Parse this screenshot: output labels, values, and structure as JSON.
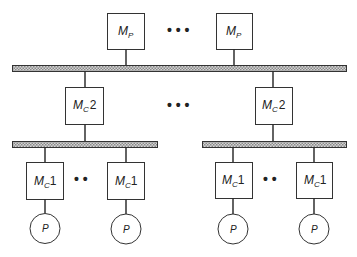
{
  "diagram": {
    "type": "hierarchical memory bus diagram",
    "colors": {
      "line": "#222222",
      "bus_fill": "#c8c8c8",
      "bus_hatch": "#8a8a8a",
      "background": "#ffffff"
    },
    "top_memories": [
      {
        "label": "M",
        "subscript": "P"
      },
      {
        "label": "M",
        "subscript": "P"
      }
    ],
    "top_ellipsis": "• • •",
    "level2_caches": [
      {
        "label": "M",
        "subscript": "C",
        "suffix": "2"
      },
      {
        "label": "M",
        "subscript": "C",
        "suffix": "2"
      }
    ],
    "level2_ellipsis": "• • •",
    "level1_caches": [
      {
        "label": "M",
        "subscript": "C",
        "suffix": "1"
      },
      {
        "label": "M",
        "subscript": "C",
        "suffix": "1"
      },
      {
        "label": "M",
        "subscript": "C",
        "suffix": "1"
      },
      {
        "label": "M",
        "subscript": "C",
        "suffix": "1"
      }
    ],
    "level1_ellipsis_left": "•   •",
    "level1_ellipsis_right": "•   •",
    "processors": [
      {
        "label": "P"
      },
      {
        "label": "P"
      },
      {
        "label": "P"
      },
      {
        "label": "P"
      }
    ]
  }
}
